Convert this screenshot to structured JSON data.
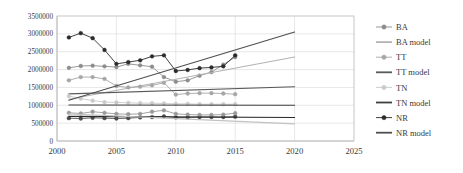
{
  "chart_data": {
    "type": "line",
    "title": "",
    "xlabel": "",
    "ylabel": "",
    "xlim": [
      2000,
      2025
    ],
    "ylim": [
      0,
      3500000
    ],
    "xticks": [
      "2000",
      "2005",
      "2010",
      "2015",
      "2020",
      "2025"
    ],
    "yticks": [
      "0",
      "500000",
      "1000000",
      "1500000",
      "2000000",
      "2500000",
      "3000000",
      "3500000"
    ],
    "grid": true,
    "legend_position": "right",
    "colors": {
      "BA": "#8c8c8c",
      "BA model": "#b3b3b3",
      "TT": "#a6a6a6",
      "TT model": "#595959",
      "TN": "#c9c9c9",
      "TN model": "#3f3f3f",
      "NR": "#2b2b2b",
      "NR model": "#4f4f4f"
    },
    "x": [
      2001,
      2002,
      2003,
      2004,
      2005,
      2006,
      2007,
      2008,
      2009,
      2010,
      2011,
      2012,
      2013,
      2014,
      2015
    ],
    "series": [
      {
        "name": "BA",
        "marker": true,
        "values": [
          2050000,
          2100000,
          2110000,
          2090000,
          2070000,
          2160000,
          2120000,
          2080000,
          1790000,
          1660000,
          1700000,
          1830000,
          1930000,
          2140000,
          2350000
        ]
      },
      {
        "name": "BA model",
        "marker": false,
        "x": [
          2001,
          2020
        ],
        "values": [
          1170000,
          2350000
        ]
      },
      {
        "name": "TT",
        "marker": true,
        "values": [
          1700000,
          1790000,
          1790000,
          1740000,
          1540000,
          1500000,
          1520000,
          1560000,
          1630000,
          1300000,
          1330000,
          1340000,
          1340000,
          1330000,
          1310000
        ]
      },
      {
        "name": "TT model",
        "marker": false,
        "x": [
          2001,
          2020
        ],
        "values": [
          1320000,
          1520000
        ]
      },
      {
        "name": "TN",
        "marker": true,
        "values": [
          1260000,
          1190000,
          1130000,
          1090000,
          1080000,
          1070000,
          1060000,
          1060000,
          1050000,
          1040000,
          1040000,
          1030000,
          1030000,
          1030000,
          1030000
        ]
      },
      {
        "name": "TN model",
        "marker": false,
        "x": [
          2001,
          2020
        ],
        "values": [
          1010000,
          1000000
        ]
      },
      {
        "name": "NR",
        "marker": true,
        "values": [
          2900000,
          3020000,
          2880000,
          2550000,
          2160000,
          2210000,
          2260000,
          2370000,
          2400000,
          1960000,
          1990000,
          2040000,
          2060000,
          2090000,
          2400000
        ]
      },
      {
        "name": "NR model",
        "marker": false,
        "x": [
          2001,
          2020
        ],
        "values": [
          1140000,
          3050000
        ]
      },
      {
        "name": "NR low",
        "marker": true,
        "values": [
          640000,
          630000,
          650000,
          640000,
          630000,
          640000,
          660000,
          670000,
          690000,
          660000,
          660000,
          670000,
          670000,
          670000,
          680000
        ]
      },
      {
        "name": "TN low",
        "marker": true,
        "values": [
          790000,
          770000,
          820000,
          790000,
          760000,
          750000,
          760000,
          820000,
          860000,
          760000,
          740000,
          730000,
          730000,
          740000,
          780000
        ]
      },
      {
        "name": "low model a",
        "marker": false,
        "x": [
          2001,
          2020
        ],
        "values": [
          690000,
          660000
        ]
      },
      {
        "name": "low model b",
        "marker": false,
        "x": [
          2001,
          2020
        ],
        "values": [
          760000,
          480000
        ]
      }
    ],
    "legend": [
      {
        "label": "BA",
        "type": "marker-line",
        "color": "#8c8c8c"
      },
      {
        "label": "BA model",
        "type": "line",
        "color": "#b3b3b3"
      },
      {
        "label": "TT",
        "type": "marker-line",
        "color": "#a6a6a6"
      },
      {
        "label": "TT model",
        "type": "line",
        "color": "#595959"
      },
      {
        "label": "TN",
        "type": "marker-line",
        "color": "#c9c9c9"
      },
      {
        "label": "TN model",
        "type": "line",
        "color": "#3f3f3f"
      },
      {
        "label": "NR",
        "type": "marker-line",
        "color": "#2b2b2b"
      },
      {
        "label": "NR model",
        "type": "line",
        "color": "#4f4f4f"
      }
    ]
  }
}
